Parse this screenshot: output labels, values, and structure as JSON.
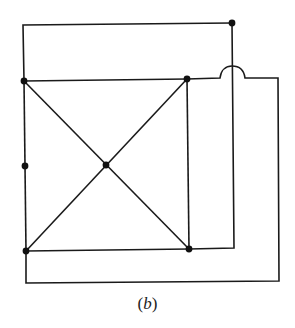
{
  "figure": {
    "caption": "(b)",
    "caption_parts": {
      "open": "(",
      "letter": "b",
      "close": ")"
    },
    "stroke_color": "#1a1a1a",
    "node_color": "#111111"
  },
  "graph": {
    "nodes": [
      {
        "id": "top-right-outer",
        "x": 232,
        "y": 23
      },
      {
        "id": "square-top-left",
        "x": 24,
        "y": 81
      },
      {
        "id": "square-top-right",
        "x": 187,
        "y": 79
      },
      {
        "id": "left-middle",
        "x": 25,
        "y": 166
      },
      {
        "id": "center",
        "x": 106,
        "y": 165
      },
      {
        "id": "square-bottom-left",
        "x": 26,
        "y": 251
      },
      {
        "id": "square-bottom-right",
        "x": 189,
        "y": 249
      }
    ],
    "edges": [
      [
        "square-top-left",
        "square-top-right"
      ],
      [
        "square-top-left",
        "left-middle"
      ],
      [
        "left-middle",
        "square-bottom-left"
      ],
      [
        "square-bottom-left",
        "square-bottom-right"
      ],
      [
        "square-top-right",
        "square-bottom-right"
      ],
      [
        "square-top-left",
        "center"
      ],
      [
        "center",
        "square-bottom-right"
      ],
      [
        "square-top-right",
        "center"
      ],
      [
        "center",
        "square-bottom-left"
      ],
      [
        "square-top-left",
        "top-right-outer"
      ],
      [
        "top-right-outer",
        "square-bottom-right"
      ],
      [
        "square-top-right",
        "square-bottom-left"
      ]
    ],
    "crossing_note": "edge from square-top-right hops over vertical edge from top-right-outer"
  }
}
